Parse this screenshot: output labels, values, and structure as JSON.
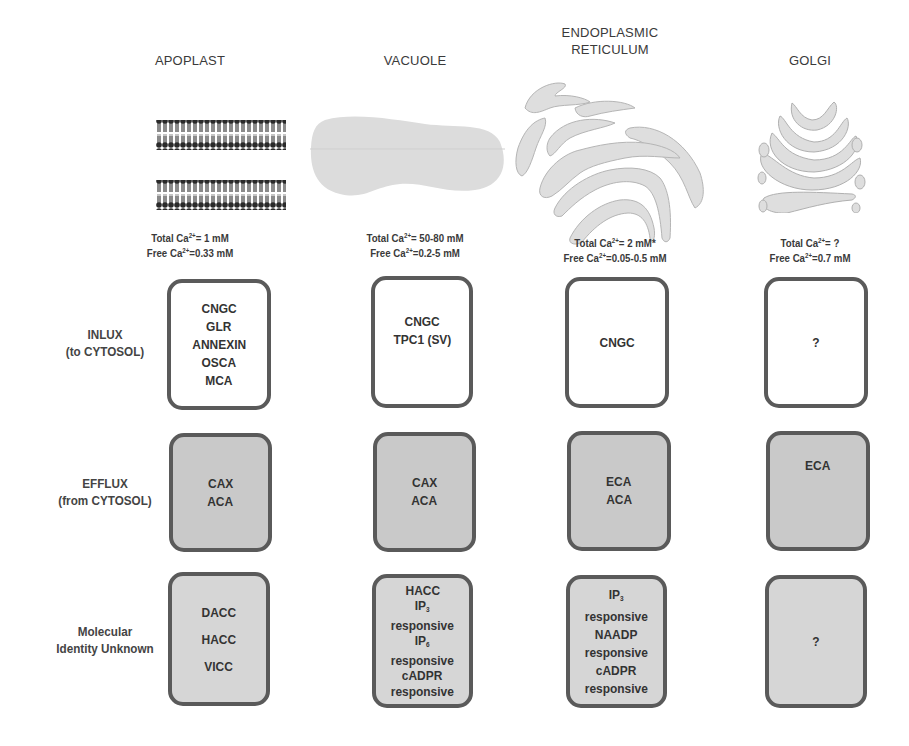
{
  "columns": [
    {
      "title": "APOPLAST",
      "total_ca": "Total Ca",
      "total_val": "= 1 mM",
      "free_ca": "Free Ca",
      "free_val": "=0.33 mM",
      "illustration": "lipid-bilayer-membrane"
    },
    {
      "title": "VACUOLE",
      "total_ca": "Total Ca",
      "total_val": "= 50-80 mM",
      "free_ca": "Free Ca",
      "free_val": "=0.2-5 mM",
      "illustration": "vacuole-shape"
    },
    {
      "title_line1": "ENDOPLASMIC",
      "title_line2": "RETICULUM",
      "total_ca": "Total Ca",
      "total_val": "= 2 mM*",
      "free_ca": "Free Ca",
      "free_val": "=0.05-0.5 mM",
      "illustration": "endoplasmic-reticulum-shape"
    },
    {
      "title": "GOLGI",
      "total_ca": "Total Ca",
      "total_val": "= ?",
      "free_ca": "Free Ca",
      "free_val": "=0.7 mM",
      "illustration": "golgi-shape"
    }
  ],
  "ion_superscript": "2+",
  "rows": [
    {
      "label_line1": "INLUX",
      "label_line2": "(to CYTOSOL)",
      "cells": [
        [
          "CNGC",
          "GLR",
          "ANNEXIN",
          "OSCA",
          "MCA"
        ],
        [
          "CNGC",
          "TPC1 (SV)"
        ],
        [
          "CNGC"
        ],
        [
          "?"
        ]
      ]
    },
    {
      "label_line1": "EFFLUX",
      "label_line2": "(from CYTOSOL)",
      "cells": [
        [
          "CAX",
          "ACA"
        ],
        [
          "CAX",
          "ACA"
        ],
        [
          "ECA",
          "ACA"
        ],
        [
          "ECA"
        ]
      ]
    },
    {
      "label_line1": "Molecular",
      "label_line2": "Identity Unknown",
      "cells": [
        [
          "DACC",
          "HACC",
          "VICC"
        ],
        [
          "HACC",
          "IP",
          "responsive",
          "IP",
          "responsive",
          "cADPR",
          "responsive"
        ],
        [
          "IP",
          "responsive",
          "NAADP",
          "responsive",
          "cADPR",
          "responsive"
        ],
        [
          "?"
        ]
      ]
    }
  ],
  "subscripts": {
    "ip3": "3",
    "ip6": "6"
  },
  "colors": {
    "box_border": "#5a5a5a",
    "influx_fill": "#ffffff",
    "efflux_fill": "#c9c9c9",
    "unknown_fill": "#d6d6d6",
    "organelle_fill": "#dcdcdc",
    "membrane": "#2a2a2a"
  }
}
